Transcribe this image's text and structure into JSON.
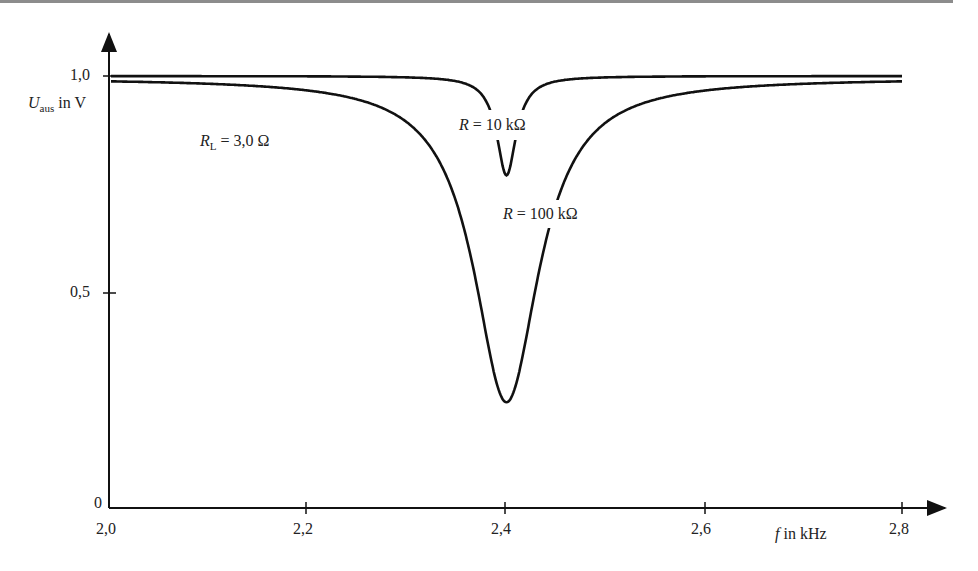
{
  "chart_data": {
    "type": "line",
    "title": "",
    "xlabel": "f in kHz",
    "ylabel": "U_aus in V",
    "xlim": [
      2.0,
      2.8
    ],
    "ylim": [
      0,
      1.0
    ],
    "x_ticks": [
      "2,0",
      "2,2",
      "2,4",
      "2,6",
      "2,8"
    ],
    "y_ticks": [
      "0",
      "0,5",
      "1,0"
    ],
    "grid": false,
    "annotations": [
      "R_L = 3,0 Ω",
      "R = 10 kΩ",
      "R = 100 kΩ"
    ],
    "series": [
      {
        "name": "R = 10 kΩ",
        "x": [
          2.0,
          2.2,
          2.3,
          2.35,
          2.38,
          2.39,
          2.4,
          2.41,
          2.42,
          2.45,
          2.5,
          2.6,
          2.8
        ],
        "values": [
          1.0,
          0.995,
          0.99,
          0.97,
          0.9,
          0.83,
          0.77,
          0.83,
          0.9,
          0.97,
          0.99,
          0.995,
          1.0
        ]
      },
      {
        "name": "R = 100 kΩ",
        "x": [
          2.0,
          2.1,
          2.2,
          2.3,
          2.35,
          2.38,
          2.4,
          2.42,
          2.45,
          2.5,
          2.6,
          2.7,
          2.8
        ],
        "values": [
          0.995,
          0.985,
          0.96,
          0.86,
          0.68,
          0.4,
          0.25,
          0.4,
          0.68,
          0.86,
          0.96,
          0.985,
          0.995
        ]
      }
    ]
  },
  "labels": {
    "y_axis_U": "U",
    "y_axis_sub": "aus",
    "y_axis_unit": " in V",
    "x_axis_f": "f",
    "x_axis_unit": " in kHz",
    "rl_R": "R",
    "rl_sub": "L",
    "rl_value": " = 3,0 Ω",
    "r10_R": "R",
    "r10_value": " = 10 kΩ",
    "r100_R": "R",
    "r100_value": " = 100 kΩ",
    "tick_y0": "0",
    "tick_y05": "0,5",
    "tick_y1": "1,0",
    "tick_x20": "2,0",
    "tick_x22": "2,2",
    "tick_x24": "2,4",
    "tick_x26": "2,6",
    "tick_x28": "2,8"
  }
}
